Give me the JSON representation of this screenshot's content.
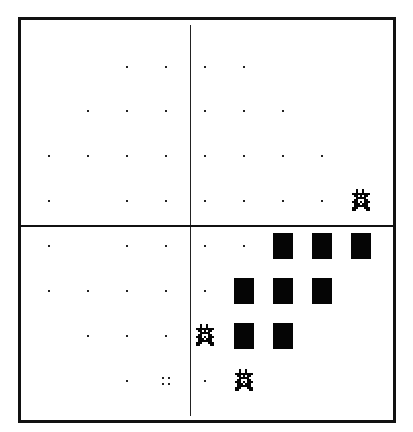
{
  "board": {
    "columns": 9,
    "rows": 8,
    "col_centers_px": [
      49,
      88,
      127,
      166,
      205,
      244,
      283,
      322,
      361
    ],
    "row_centers_px": [
      67,
      111,
      156,
      201,
      246,
      291,
      336,
      381
    ],
    "divider_column_after": 3,
    "divider_row_after": 3,
    "colors": {
      "line": "#111111",
      "piece": "#050505",
      "background": "#ffffff"
    }
  },
  "legend": {
    "dot": "empty-marker",
    "rect": "filled-block",
    "glyph": "pixel-sprite",
    "quad": "four-dot-marker"
  },
  "cells": [
    {
      "r": 0,
      "c": 2,
      "type": "dot"
    },
    {
      "r": 0,
      "c": 3,
      "type": "dot"
    },
    {
      "r": 0,
      "c": 4,
      "type": "dot"
    },
    {
      "r": 0,
      "c": 5,
      "type": "dot"
    },
    {
      "r": 1,
      "c": 1,
      "type": "dot"
    },
    {
      "r": 1,
      "c": 2,
      "type": "dot"
    },
    {
      "r": 1,
      "c": 3,
      "type": "dot"
    },
    {
      "r": 1,
      "c": 4,
      "type": "dot"
    },
    {
      "r": 1,
      "c": 5,
      "type": "dot"
    },
    {
      "r": 1,
      "c": 6,
      "type": "dot"
    },
    {
      "r": 2,
      "c": 0,
      "type": "dot"
    },
    {
      "r": 2,
      "c": 1,
      "type": "dot"
    },
    {
      "r": 2,
      "c": 2,
      "type": "dot"
    },
    {
      "r": 2,
      "c": 3,
      "type": "dot"
    },
    {
      "r": 2,
      "c": 4,
      "type": "dot"
    },
    {
      "r": 2,
      "c": 5,
      "type": "dot"
    },
    {
      "r": 2,
      "c": 6,
      "type": "dot"
    },
    {
      "r": 2,
      "c": 7,
      "type": "dot"
    },
    {
      "r": 3,
      "c": 0,
      "type": "dot"
    },
    {
      "r": 3,
      "c": 2,
      "type": "dot"
    },
    {
      "r": 3,
      "c": 3,
      "type": "dot"
    },
    {
      "r": 3,
      "c": 4,
      "type": "dot"
    },
    {
      "r": 3,
      "c": 5,
      "type": "dot"
    },
    {
      "r": 3,
      "c": 6,
      "type": "dot"
    },
    {
      "r": 3,
      "c": 7,
      "type": "dot"
    },
    {
      "r": 3,
      "c": 8,
      "type": "glyph"
    },
    {
      "r": 4,
      "c": 0,
      "type": "dot"
    },
    {
      "r": 4,
      "c": 2,
      "type": "dot"
    },
    {
      "r": 4,
      "c": 3,
      "type": "dot"
    },
    {
      "r": 4,
      "c": 4,
      "type": "dot"
    },
    {
      "r": 4,
      "c": 5,
      "type": "dot"
    },
    {
      "r": 4,
      "c": 6,
      "type": "rect"
    },
    {
      "r": 4,
      "c": 7,
      "type": "rect"
    },
    {
      "r": 4,
      "c": 8,
      "type": "rect"
    },
    {
      "r": 5,
      "c": 0,
      "type": "dot"
    },
    {
      "r": 5,
      "c": 1,
      "type": "dot"
    },
    {
      "r": 5,
      "c": 2,
      "type": "dot"
    },
    {
      "r": 5,
      "c": 3,
      "type": "dot"
    },
    {
      "r": 5,
      "c": 4,
      "type": "dot"
    },
    {
      "r": 5,
      "c": 5,
      "type": "rect"
    },
    {
      "r": 5,
      "c": 6,
      "type": "rect"
    },
    {
      "r": 5,
      "c": 7,
      "type": "rect"
    },
    {
      "r": 6,
      "c": 1,
      "type": "dot"
    },
    {
      "r": 6,
      "c": 2,
      "type": "dot"
    },
    {
      "r": 6,
      "c": 3,
      "type": "dot"
    },
    {
      "r": 6,
      "c": 4,
      "type": "glyph"
    },
    {
      "r": 6,
      "c": 5,
      "type": "rect"
    },
    {
      "r": 6,
      "c": 6,
      "type": "rect"
    },
    {
      "r": 7,
      "c": 2,
      "type": "dot"
    },
    {
      "r": 7,
      "c": 3,
      "type": "quad"
    },
    {
      "r": 7,
      "c": 4,
      "type": "dot"
    },
    {
      "r": 7,
      "c": 5,
      "type": "glyph"
    }
  ]
}
